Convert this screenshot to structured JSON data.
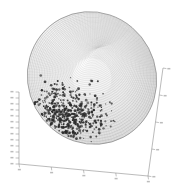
{
  "figure": {
    "title": "",
    "background_color": "#ffffff",
    "width": 179,
    "height": 191
  },
  "chart_data": {
    "type": "scatter",
    "title": "",
    "subtitle": "",
    "xlabel": "",
    "ylabel": "",
    "zlabel": "",
    "grid": false,
    "legend": null,
    "projection": "3d",
    "surface": {
      "shape": "ellipsoid",
      "render": "wireframe-mesh",
      "mesh_pattern": "concentric-rings",
      "mesh_color": "#9a9a9a",
      "fill_color": "#f2f2f2",
      "shading": "light-gray-gradient",
      "center_px": [
        92,
        78
      ],
      "radius_x_px": 64,
      "radius_y_px": 67,
      "rotation_deg": -28
    },
    "points": {
      "count": 520,
      "color": "#2b2b2b",
      "marker": "dot",
      "marker_size_px": 1.1,
      "cluster_center_px": [
        66,
        116
      ],
      "cluster_spread_px": [
        34,
        24
      ],
      "region": "lower-left surface of ellipsoid"
    },
    "axes": [
      {
        "id": "axis-vertical-left",
        "orientation": "vertical",
        "position": "left",
        "start_px": [
          19,
          92
        ],
        "end_px": [
          19,
          164
        ],
        "tick_count": 13,
        "tick_direction": "left",
        "tick_labels": [
          "",
          "",
          "",
          "",
          "",
          "",
          "",
          "",
          "",
          "",
          "",
          "",
          ""
        ],
        "labels_legible": false,
        "color": "#8d8d8d"
      },
      {
        "id": "axis-bottom",
        "orientation": "diagonal",
        "position": "bottom",
        "start_px": [
          19,
          164
        ],
        "end_px": [
          148,
          176
        ],
        "tick_count": 5,
        "tick_direction": "down",
        "tick_labels": [
          "",
          "",
          "",
          "",
          ""
        ],
        "labels_legible": false,
        "color": "#8d8d8d"
      },
      {
        "id": "axis-right-depth",
        "orientation": "diagonal",
        "position": "right",
        "start_px": [
          163,
          68
        ],
        "end_px": [
          148,
          176
        ],
        "tick_count": 5,
        "tick_direction": "right",
        "tick_labels": [
          "",
          "",
          "",
          "",
          ""
        ],
        "labels_legible": false,
        "color": "#8d8d8d"
      }
    ],
    "colors": {
      "axis": "#8d8d8d",
      "mesh": "#9a9a9a",
      "points": "#2b2b2b",
      "background": "#ffffff"
    }
  }
}
